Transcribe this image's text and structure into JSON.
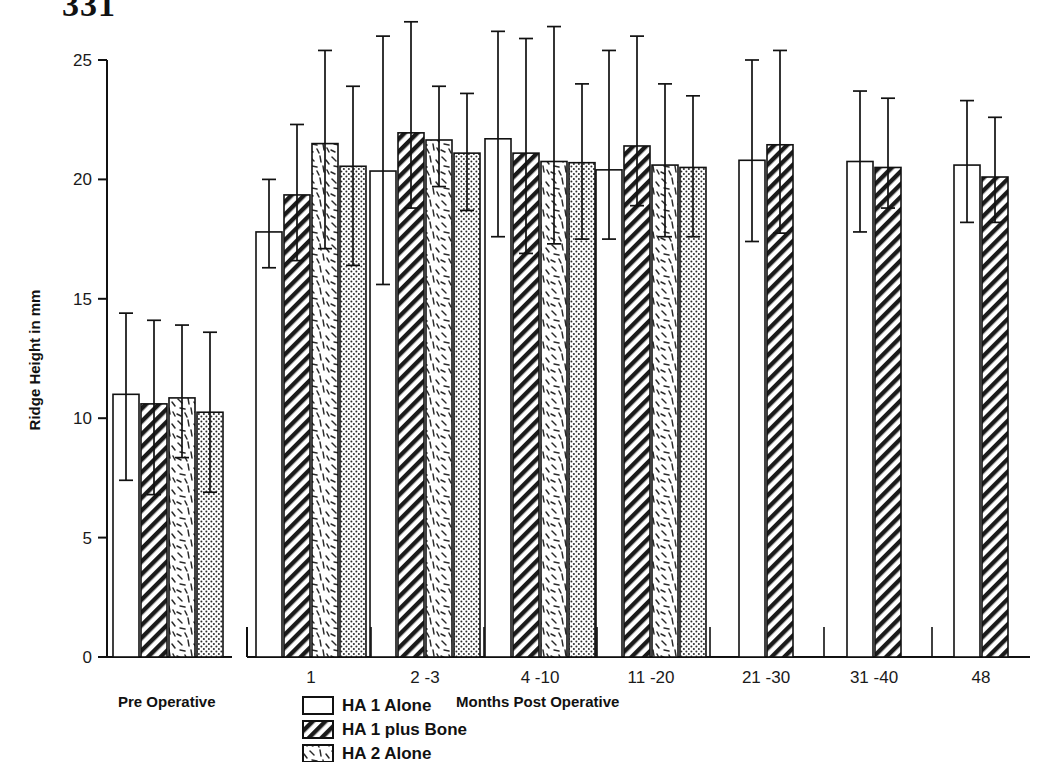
{
  "page": {
    "number": "331"
  },
  "chart_data": {
    "type": "bar",
    "title": "",
    "xlabel": "Months Post Operative",
    "ylabel": "Ridge Height in mm",
    "ylim": [
      0,
      25
    ],
    "yticks": [
      0,
      5,
      10,
      15,
      20,
      25
    ],
    "ytick_labels": [
      "0",
      "5",
      "10",
      "15",
      "20",
      "25"
    ],
    "grid": false,
    "legend_position": "bottom-center",
    "error_bars": "standard deviation",
    "group_label_left": "Pre Operative",
    "categories": [
      "Pre Operative",
      "1",
      "2 -3",
      "4 -10",
      "11 -20",
      "21 -30",
      "31 -40",
      "48"
    ],
    "series": [
      {
        "name": "HA 1 Alone",
        "pattern": "open",
        "values": [
          11.0,
          17.8,
          20.35,
          21.7,
          20.4,
          20.8,
          20.75,
          20.6
        ],
        "err_low": [
          7.4,
          16.3,
          15.6,
          17.6,
          17.5,
          17.4,
          17.8,
          18.2
        ],
        "err_high": [
          14.4,
          20.0,
          26.0,
          26.2,
          25.4,
          25.0,
          23.7,
          23.3
        ]
      },
      {
        "name": "HA 1 plus Bone",
        "pattern": "hatch",
        "values": [
          10.6,
          19.35,
          21.95,
          21.1,
          21.4,
          21.45,
          20.5,
          20.1
        ],
        "err_low": [
          6.8,
          16.6,
          18.8,
          16.9,
          18.9,
          17.75,
          18.8,
          18.2
        ],
        "err_high": [
          14.1,
          22.3,
          26.6,
          25.9,
          26.0,
          25.4,
          23.4,
          22.6
        ]
      },
      {
        "name": "HA 2 Alone",
        "pattern": "dash",
        "values": [
          10.85,
          21.5,
          21.65,
          20.75,
          20.6,
          null,
          null,
          null
        ],
        "err_low": [
          8.35,
          17.1,
          19.7,
          17.3,
          17.6,
          null,
          null,
          null
        ],
        "err_high": [
          13.9,
          25.4,
          23.9,
          26.4,
          24.0,
          null,
          null,
          null
        ]
      },
      {
        "name": "HA 2 plus Bone",
        "pattern": "dots",
        "values": [
          10.25,
          20.55,
          21.1,
          20.7,
          20.5,
          null,
          null,
          null
        ],
        "err_low": [
          6.9,
          16.4,
          18.7,
          17.5,
          17.6,
          null,
          null,
          null
        ],
        "err_high": [
          13.6,
          23.9,
          23.6,
          24.0,
          23.5,
          null,
          null,
          null
        ]
      }
    ]
  },
  "legend": {
    "items": [
      {
        "label": "HA 1 Alone",
        "pattern": "open"
      },
      {
        "label": "HA 1 plus Bone",
        "pattern": "hatch"
      },
      {
        "label": "HA 2 Alone",
        "pattern": "dash"
      }
    ]
  }
}
